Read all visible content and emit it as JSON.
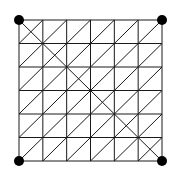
{
  "diagram": {
    "type": "triangulated-grid",
    "rows": 6,
    "cols": 6,
    "origin": [
      19,
      20
    ],
    "size": [
      143,
      141
    ],
    "line_color": "#1a1a1a",
    "line_width": 1,
    "cell_diagonal": "bottom-left-to-top-right",
    "main_diagonal": "top-left-to-bottom-right",
    "corner_dots": [
      {
        "name": "top-left",
        "x": 19,
        "y": 20
      },
      {
        "name": "top-right",
        "x": 162,
        "y": 20
      },
      {
        "name": "bottom-left",
        "x": 19,
        "y": 161
      },
      {
        "name": "bottom-right",
        "x": 162,
        "y": 161
      }
    ],
    "dot_radius": 5,
    "dot_color": "#000000"
  }
}
